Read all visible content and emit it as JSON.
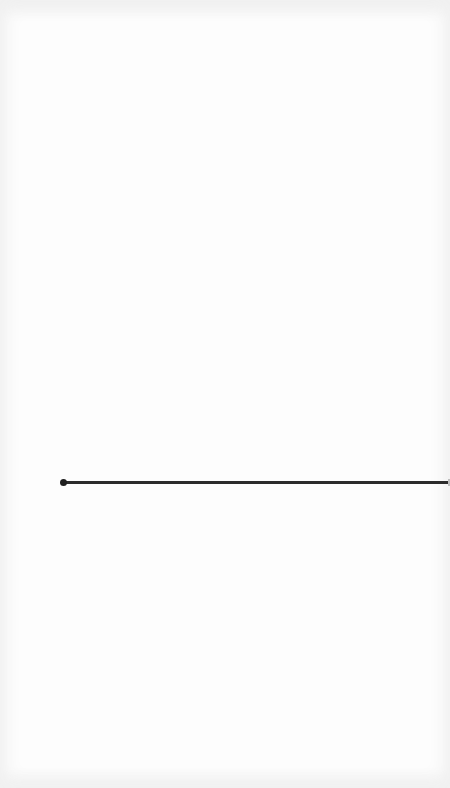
{
  "canvas": {
    "background": "#fdfdfd",
    "line_color": "#2b2b2b"
  },
  "line": {
    "start_x": 63,
    "end_x": 450,
    "y": 482,
    "has_start_dot": true
  }
}
